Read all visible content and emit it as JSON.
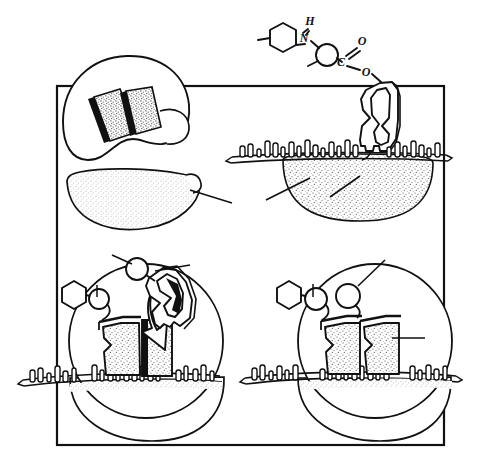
{
  "figure": {
    "kind": "hand-drawn scientific schematic",
    "background_color": "#ffffff",
    "ink_color": "#111111",
    "stipple_color": "#6b6b6b",
    "frame": {
      "name": "outer-rectangle-border",
      "x": 57,
      "y": 86,
      "width": 387,
      "height": 359,
      "stroke_width": 2.2
    },
    "panel_count": 4
  },
  "molecule": {
    "name": "beta-lactam-antibiotic-structure",
    "atom_labels": [
      {
        "text": "H",
        "x": 310,
        "y": 25
      },
      {
        "text": "N",
        "x": 304,
        "y": 38
      },
      {
        "text": "O",
        "x": 362,
        "y": 44
      },
      {
        "text": "C",
        "x": 341,
        "y": 61
      },
      {
        "text": "O",
        "x": 367,
        "y": 70
      }
    ],
    "ring_label": "benzene-hexagon",
    "sphere_label": "carbon-sphere"
  },
  "panels": [
    {
      "id": "panel-top-left",
      "name": "magnified-active-site-inset",
      "caption": "",
      "elements": [
        "magnifier-circle",
        "stippled-block-left",
        "stippled-block-right",
        "stippled-cell-body",
        "leader-line"
      ]
    },
    {
      "id": "panel-top-right",
      "name": "antibiotic-approaching-membrane",
      "caption": "",
      "elements": [
        "enzyme-keyhole-shape",
        "peptidoglycan-surface",
        "surface-peg-array",
        "stippled-cell-body",
        "leader-line"
      ]
    },
    {
      "id": "panel-bottom-left",
      "name": "substrate-bound-and-antibiotic-docking",
      "caption": "",
      "elements": [
        "cell-circle",
        "bound-enzyme-left",
        "incoming-enzyme-right",
        "curved-arrow",
        "hexagon-side-chain",
        "carbon-sphere",
        "peptidoglycan-surface",
        "surface-peg-array",
        "leader-line"
      ]
    },
    {
      "id": "panel-bottom-right",
      "name": "both-sites-occupied",
      "caption": "",
      "elements": [
        "cell-circle",
        "bound-enzyme-left",
        "bound-enzyme-right",
        "hexagon-side-chain",
        "carbon-sphere-left",
        "carbon-sphere-right",
        "peptidoglycan-surface",
        "surface-peg-array",
        "leader-line"
      ]
    }
  ],
  "annotations": {
    "leader_lines_count": 6,
    "text_labels": []
  }
}
